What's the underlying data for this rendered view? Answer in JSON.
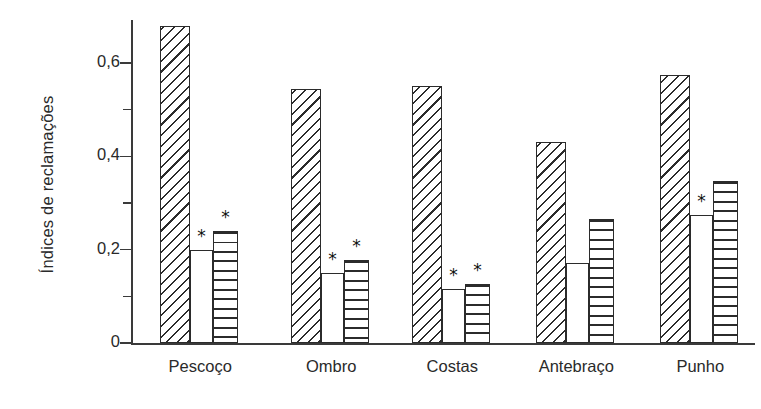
{
  "chart_data": {
    "type": "bar",
    "title": "",
    "xlabel": "",
    "ylabel": "Índices de reclamações",
    "ylim": [
      0,
      0.72
    ],
    "yticks": [
      0,
      0.2,
      0.4,
      0.6
    ],
    "ytick_labels": [
      "0",
      "0,2",
      "0,4",
      "0,6"
    ],
    "yminor_ticks": [
      0.1,
      0.3,
      0.5,
      0.7
    ],
    "grid": false,
    "legend": "none",
    "categories": [
      "Pescoço",
      "Ombro",
      "Costas",
      "Antebraço",
      "Punho"
    ],
    "series": [
      {
        "name": "diagonal-hatched",
        "pattern": "diagonal-hatch",
        "values": [
          0.68,
          0.545,
          0.55,
          0.43,
          0.575
        ],
        "significance": [
          "",
          "",
          "",
          "",
          ""
        ]
      },
      {
        "name": "plain-white",
        "pattern": "plain",
        "values": [
          0.2,
          0.15,
          0.115,
          0.172,
          0.274
        ],
        "significance": [
          "*",
          "*",
          "*",
          "",
          "*"
        ]
      },
      {
        "name": "horizontal-striped",
        "pattern": "horizontal-stripe",
        "values": [
          0.24,
          0.178,
          0.127,
          0.265,
          0.348
        ],
        "significance": [
          "*",
          "*",
          "*",
          "",
          ""
        ]
      }
    ],
    "annotation_symbol": "*",
    "colors": {
      "axis": "#3a3a3a",
      "bar_outline": "#2b2b2b",
      "bar_fill": "#ffffff",
      "text": "#2a2a2a",
      "background": "#ffffff"
    }
  }
}
